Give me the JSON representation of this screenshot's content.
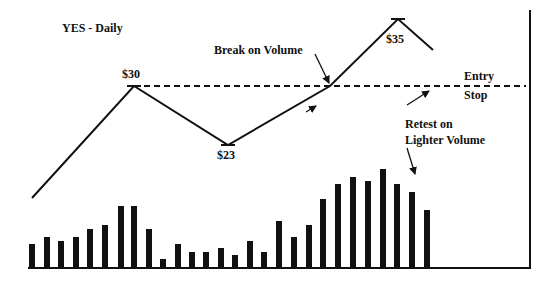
{
  "chart_data": {
    "type": "line",
    "title": "YES - Daily",
    "xlabel": "",
    "ylabel": "",
    "price_series": {
      "name": "Price",
      "points": [
        {
          "x": 32,
          "y": 198,
          "label": ""
        },
        {
          "x": 134,
          "y": 86,
          "label": "$30"
        },
        {
          "x": 228,
          "y": 145,
          "label": "$23"
        },
        {
          "x": 330,
          "y": 86,
          "label": ""
        },
        {
          "x": 398,
          "y": 19,
          "label": "$35"
        },
        {
          "x": 433,
          "y": 50,
          "label": ""
        }
      ],
      "price_levels": {
        "start": 18,
        "peak1": 30,
        "trough": 23,
        "breakout": 30,
        "peak2": 35,
        "retest": 32
      }
    },
    "reference_line": {
      "price": 30,
      "y": 86,
      "x_start": 134,
      "x_end": 526,
      "style": "dashed",
      "labels": [
        "Entry",
        "Stop"
      ]
    },
    "volume_series": {
      "name": "Volume",
      "baseline_y": 267,
      "bars": [
        {
          "x": 32,
          "top": 244
        },
        {
          "x": 47,
          "top": 237
        },
        {
          "x": 61,
          "top": 241
        },
        {
          "x": 76,
          "top": 237
        },
        {
          "x": 90,
          "top": 229
        },
        {
          "x": 105,
          "top": 225
        },
        {
          "x": 121,
          "top": 206
        },
        {
          "x": 134,
          "top": 206
        },
        {
          "x": 149,
          "top": 229
        },
        {
          "x": 163,
          "top": 259
        },
        {
          "x": 178,
          "top": 244
        },
        {
          "x": 192,
          "top": 252
        },
        {
          "x": 206,
          "top": 252
        },
        {
          "x": 221,
          "top": 248
        },
        {
          "x": 235,
          "top": 255
        },
        {
          "x": 250,
          "top": 241
        },
        {
          "x": 264,
          "top": 252
        },
        {
          "x": 279,
          "top": 221
        },
        {
          "x": 294,
          "top": 237
        },
        {
          "x": 309,
          "top": 225
        },
        {
          "x": 323,
          "top": 199
        },
        {
          "x": 338,
          "top": 184
        },
        {
          "x": 353,
          "top": 177
        },
        {
          "x": 368,
          "top": 181
        },
        {
          "x": 383,
          "top": 169
        },
        {
          "x": 397,
          "top": 184
        },
        {
          "x": 412,
          "top": 192
        },
        {
          "x": 427,
          "top": 210
        }
      ],
      "relative_values": [
        23,
        30,
        26,
        30,
        38,
        42,
        61,
        61,
        38,
        8,
        23,
        15,
        15,
        19,
        12,
        26,
        15,
        46,
        30,
        42,
        68,
        83,
        90,
        86,
        98,
        83,
        75,
        57
      ]
    },
    "annotations": [
      {
        "text": "Break on Volume",
        "arrow_to": [
          330,
          84
        ]
      },
      {
        "text": "Retest on Lighter Volume",
        "arrow_to": [
          430,
          90
        ]
      }
    ],
    "axes": {
      "right_axis_x": 530,
      "top_y": 10,
      "baseline_y": 268
    },
    "grid": false,
    "legend": "none"
  },
  "labels": {
    "title": "YES - Daily",
    "p30": "$30",
    "p23": "$23",
    "p35": "$35",
    "break": "Break on Volume",
    "entry": "Entry",
    "stop": "Stop",
    "retest1": "Retest on",
    "retest2": "Lighter Volume"
  }
}
